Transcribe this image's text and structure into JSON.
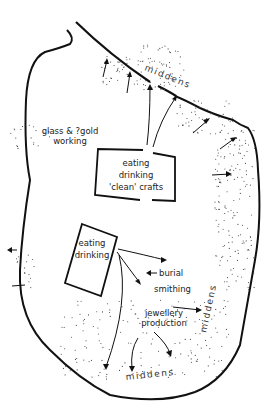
{
  "diagram": {
    "zones": {
      "clean_box": [
        "eating",
        "drinking",
        "'clean' crafts"
      ],
      "inner_box": [
        "eating",
        "drinking"
      ],
      "glass_working": [
        "glass & ?gold",
        "working"
      ],
      "burial": "burial",
      "smithing": "smithing",
      "jewellery": [
        "jewellery",
        "production"
      ]
    },
    "middens": {
      "top": "middens",
      "right": "middens",
      "bottom": "middens"
    },
    "colors": {
      "ink": "#111111",
      "background": "#ffffff",
      "text": "#222222"
    }
  }
}
